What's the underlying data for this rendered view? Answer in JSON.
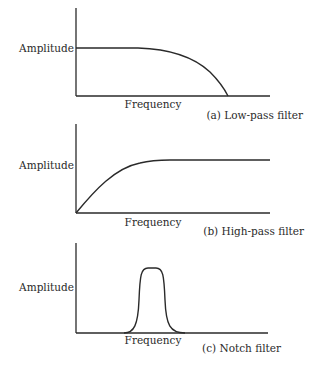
{
  "figure": {
    "panels": [
      {
        "id": "a",
        "ylabel": "Amplitude",
        "xlabel": "Frequency",
        "caption": "(a)  Low-pass filter",
        "type": "low-pass"
      },
      {
        "id": "b",
        "ylabel": "Amplitude",
        "xlabel": "Frequency",
        "caption": "(b)  High-pass filter",
        "type": "high-pass"
      },
      {
        "id": "c",
        "ylabel": "Amplitude",
        "xlabel": "Frequency",
        "caption": "(c)  Notch filter",
        "type": "band-pass bump"
      }
    ],
    "colors": {
      "ink": "#2a2a2a",
      "background": "#ffffff"
    }
  }
}
